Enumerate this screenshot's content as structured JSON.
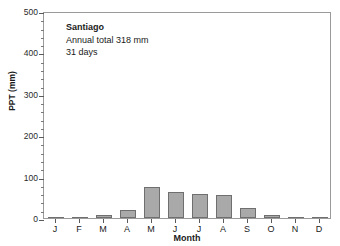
{
  "chart_data": {
    "type": "bar",
    "title": "Santiago",
    "annotation_lines": [
      "Santiago",
      "Annual total 318 mm",
      "31 days"
    ],
    "categories": [
      "J",
      "F",
      "M",
      "A",
      "M",
      "J",
      "J",
      "A",
      "S",
      "O",
      "N",
      "D"
    ],
    "values": [
      0,
      0,
      7,
      20,
      74,
      64,
      57,
      55,
      25,
      7,
      1,
      1
    ],
    "xlabel": "Month",
    "ylabel": "PPT (mm)",
    "ylim": [
      0,
      500
    ],
    "ytick_labels": [
      "0",
      "100",
      "200",
      "300",
      "400",
      "500"
    ],
    "ytick_values": [
      0,
      100,
      200,
      300,
      400,
      500
    ],
    "yminor_step": 20,
    "grid": false,
    "legend": null,
    "bar_fill": "#a9a9a9",
    "bar_edge": "#6f6f6f",
    "frame_color": "#9a9a9a"
  },
  "annotation": {
    "station": "Santiago",
    "annual_total": "Annual total 318 mm",
    "rain_days": "31 days"
  },
  "axes": {
    "y_title": "PPT (mm)",
    "x_title": "Month"
  }
}
